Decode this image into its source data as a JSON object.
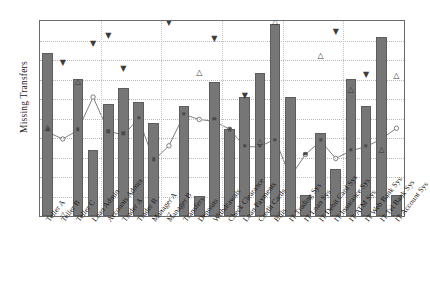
{
  "chart_data": {
    "type": "bar",
    "title": "",
    "subtitle": "",
    "xlabel": "",
    "ylabel": "Missing Transfers",
    "ylim": [
      0,
      10
    ],
    "grid": true,
    "legend": "none",
    "axis_tick_labels_visible": false,
    "categories": [
      "Teller A",
      "Teller B",
      "Teller C",
      "Loan Admin",
      "Accounts Admin",
      "Trader A",
      "Trader B",
      "Manager A",
      "Manager B",
      "Transfers",
      "Deposits",
      "Withdrawals",
      "Check Clearance",
      "Loan Payments",
      "Credit Cards",
      "Bills",
      "IT Trading Sys",
      "IT Loan Sys",
      "IT Debit Card Sys",
      "IT Insurance Sys",
      "IT ATM Sys",
      "IT Web Bank Sys",
      "IT Tel Bank Sys",
      "IT Account Sys"
    ],
    "series": [
      {
        "name": "bars",
        "type": "bar",
        "color": "#767676",
        "values": [
          8.35,
          0.0,
          7.05,
          3.38,
          5.75,
          6.55,
          5.85,
          4.75,
          0.0,
          5.65,
          1.05,
          6.85,
          4.45,
          6.1,
          7.35,
          9.85,
          6.1,
          1.1,
          4.25,
          2.4,
          7.05,
          5.65,
          9.2,
          1.1
        ]
      },
      {
        "name": "line",
        "type": "line",
        "color": "#707070",
        "marker": "open-circle",
        "values": [
          4.3,
          3.95,
          4.4,
          6.1,
          4.35,
          4.15,
          5.0,
          2.85,
          3.6,
          5.2,
          4.95,
          4.85,
          4.45,
          3.55,
          3.55,
          3.95,
          2.0,
          3.15,
          3.85,
          2.95,
          3.35,
          3.55,
          3.95,
          4.5
        ]
      },
      {
        "name": "points-square",
        "type": "scatter",
        "color": "#4a4a4a",
        "marker": "filled-square",
        "values": [
          4.45,
          null,
          4.45,
          null,
          4.35,
          4.25,
          5.05,
          2.9,
          null,
          5.25,
          null,
          5.0,
          4.45,
          3.6,
          3.6,
          3.9,
          null,
          3.2,
          3.9,
          null,
          3.4,
          3.6,
          null,
          null
        ]
      },
      {
        "name": "points-open-triangle",
        "type": "scatter",
        "color": "#3c3c3c",
        "marker": "open-triangle-up",
        "values": [
          4.5,
          0.05,
          6.85,
          null,
          null,
          null,
          null,
          null,
          0.05,
          null,
          7.35,
          null,
          null,
          null,
          3.8,
          9.95,
          null,
          null,
          8.2,
          null,
          6.45,
          null,
          3.4,
          7.2
        ]
      },
      {
        "name": "points-filled-triangle",
        "type": "scatter",
        "color": "#3c3c3c",
        "marker": "filled-triangle-down",
        "values": [
          null,
          7.85,
          null,
          8.8,
          9.25,
          7.55,
          null,
          null,
          9.9,
          null,
          null,
          9.1,
          null,
          6.15,
          null,
          null,
          null,
          null,
          null,
          9.45,
          null,
          7.25,
          null,
          null
        ]
      }
    ]
  },
  "axes": {
    "y_title": "Missing Transfers",
    "gridline_count": 9,
    "bar_color": "#767676",
    "line_color": "#707070",
    "frame_color": "#6b6b6b",
    "grid_color": "#b9b9b9"
  }
}
